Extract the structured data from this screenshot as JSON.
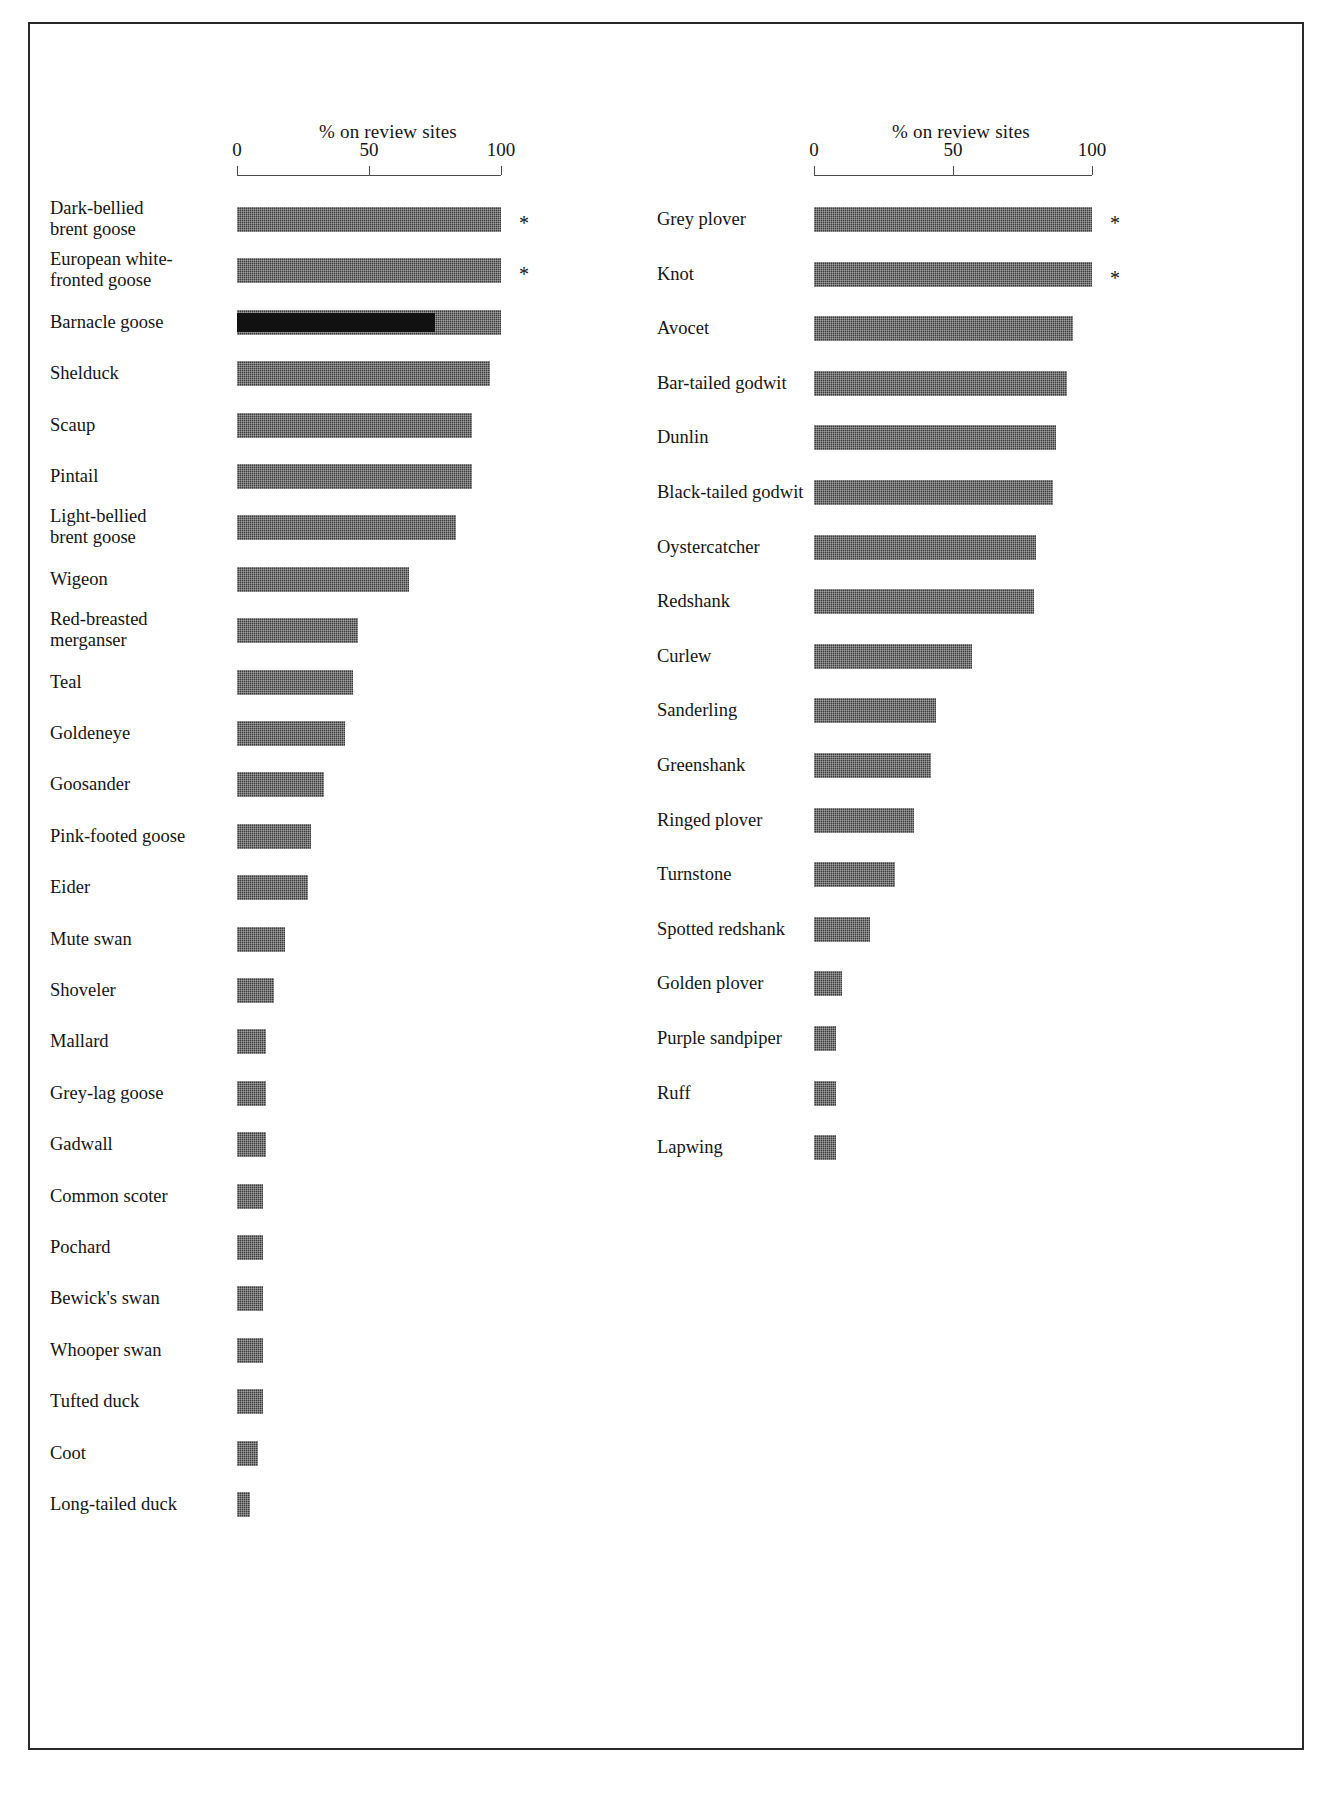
{
  "figure": {
    "background": "#ffffff",
    "frame_color": "#2a2a2a",
    "bar_color": "#3b3b3b",
    "axis_color": "#4a4a4a",
    "note_symbol": "*"
  },
  "chart_data": {
    "type": "bar",
    "orientation": "horizontal",
    "title": "",
    "xlabel": "% on review sites",
    "ylabel": "",
    "xlim": [
      0,
      100
    ],
    "xticks": [
      0,
      50,
      100
    ],
    "xticklabels": [
      "0",
      "50",
      "100"
    ],
    "grid": false,
    "legend": null,
    "panels": [
      {
        "name": "wildfowl",
        "axis_title": "% on review sites",
        "xticklabels": [
          "0",
          "50",
          "100"
        ],
        "categories": [
          "Dark-bellied\nbrent goose",
          "European white-\nfronted goose",
          "Barnacle goose",
          "Shelduck",
          "Scaup",
          "Pintail",
          "Light-bellied\nbrent goose",
          "Wigeon",
          "Red-breasted\nmerganser",
          "Teal",
          "Goldeneye",
          "Goosander",
          "Pink-footed goose",
          "Eider",
          "Mute swan",
          "Shoveler",
          "Mallard",
          "Grey-lag goose",
          "Gadwall",
          "Common scoter",
          "Pochard",
          "Bewick's swan",
          "Whooper swan",
          "Tufted duck",
          "Coot",
          "Long-tailed duck"
        ],
        "values": [
          100,
          100,
          100,
          96,
          89,
          89,
          83,
          65,
          46,
          44,
          41,
          33,
          28,
          27,
          18,
          14,
          11,
          11,
          11,
          10,
          10,
          10,
          10,
          10,
          8,
          5
        ],
        "overlay_values": [
          null,
          null,
          75,
          null,
          null,
          null,
          null,
          null,
          null,
          null,
          null,
          null,
          null,
          null,
          null,
          null,
          null,
          null,
          null,
          null,
          null,
          null,
          null,
          null,
          null,
          null
        ],
        "starred": [
          true,
          true,
          false,
          false,
          false,
          false,
          false,
          false,
          false,
          false,
          false,
          false,
          false,
          false,
          false,
          false,
          false,
          false,
          false,
          false,
          false,
          false,
          false,
          false,
          false,
          false
        ]
      },
      {
        "name": "waders",
        "axis_title": "% on review sites",
        "xticklabels": [
          "0",
          "50",
          "100"
        ],
        "categories": [
          "Grey plover",
          "Knot",
          "Avocet",
          "Bar-tailed godwit",
          "Dunlin",
          "Black-tailed godwit",
          "Oystercatcher",
          "Redshank",
          "Curlew",
          "Sanderling",
          "Greenshank",
          "Ringed plover",
          "Turnstone",
          "Spotted redshank",
          "Golden plover",
          "Purple sandpiper",
          "Ruff",
          "Lapwing"
        ],
        "values": [
          100,
          100,
          93,
          91,
          87,
          86,
          80,
          79,
          57,
          44,
          42,
          36,
          29,
          20,
          10,
          8,
          8,
          8
        ],
        "overlay_values": [
          null,
          null,
          null,
          null,
          null,
          null,
          null,
          null,
          null,
          null,
          null,
          null,
          null,
          null,
          null,
          null,
          null,
          null
        ],
        "starred": [
          true,
          true,
          false,
          false,
          false,
          false,
          false,
          false,
          false,
          false,
          false,
          false,
          false,
          false,
          false,
          false,
          false,
          false
        ]
      }
    ]
  },
  "geometry": {
    "left_panel": {
      "label_x": 20,
      "axis_x0": 207,
      "axis_px_per_unit": 2.64,
      "axis_y": 151,
      "title_x": 289,
      "title_y": 97,
      "first_row_y": 183,
      "row_step": 51.4
    },
    "right_panel": {
      "label_x": 47,
      "axis_x0": 204,
      "axis_px_per_unit": 2.78,
      "axis_y": 151,
      "title_x": 282,
      "title_y": 97,
      "first_row_y": 183,
      "row_step": 54.6
    }
  }
}
